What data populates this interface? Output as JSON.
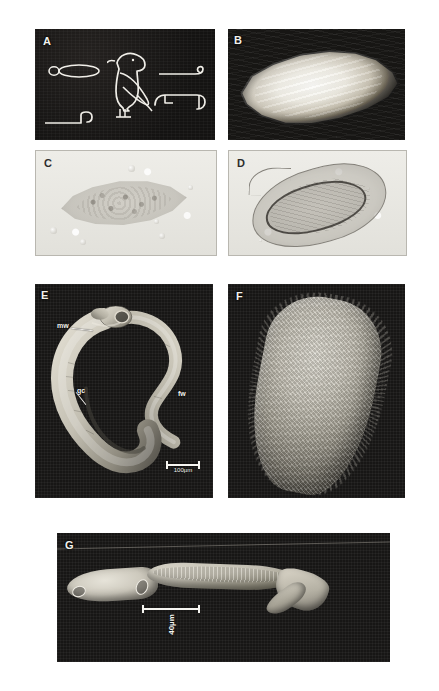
{
  "figure": {
    "background_color": "#ffffff",
    "width": 439,
    "height": 691,
    "panels": [
      {
        "id": "A",
        "letter": "A",
        "type": "line-art",
        "description": "Ancient Egyptian hieroglyphs rendered as white outlines on a black plate",
        "glyph_names": [
          "oval-with-stem-glyph",
          "bird-glyph",
          "reed-stroke-glyph",
          "hook-sign-glyph",
          "angular-sign-glyph"
        ]
      },
      {
        "id": "B",
        "letter": "B",
        "type": "photograph",
        "description": "Pale elongated lens-shaped gross specimen on dark background"
      },
      {
        "id": "C",
        "letter": "C",
        "type": "light-micrograph",
        "description": "Lemon-shaped egg with granular contents viewed by brightfield microscopy"
      },
      {
        "id": "D",
        "letter": "D",
        "type": "light-micrograph",
        "description": "Spined egg with dark-outlined inner miracidium viewed by brightfield microscopy"
      },
      {
        "id": "E",
        "letter": "E",
        "type": "scanning-electron-micrograph",
        "description": "Paired adult schistosome worms in copula",
        "labels": [
          {
            "text": "mw",
            "meaning": "male worm"
          },
          {
            "text": "gc",
            "meaning": "gynaecophoric canal"
          },
          {
            "text": "fw",
            "meaning": "female worm"
          }
        ],
        "scalebar": {
          "text": "100µm"
        }
      },
      {
        "id": "F",
        "letter": "F",
        "type": "scanning-electron-micrograph",
        "description": "Ciliated miracidium with textured epidermal plate surface"
      },
      {
        "id": "G",
        "letter": "G",
        "type": "scanning-electron-micrograph",
        "description": "Cercaria with oral sucker, body and forked tail",
        "scalebar": {
          "text": "40µm"
        }
      }
    ]
  }
}
